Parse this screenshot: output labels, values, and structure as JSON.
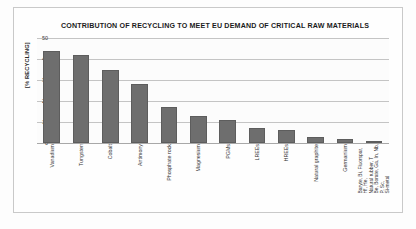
{
  "chart_data": {
    "type": "bar",
    "title": "CONTRIBUTION OF RECYCLING TO MEET EU DEMAND OF CRITICAL RAW MATERIALS",
    "xlabel": "",
    "ylabel": "[% RECYCLING]",
    "ylim": [
      0,
      50
    ],
    "yticks": [
      0,
      10,
      20,
      30,
      40,
      50
    ],
    "grid": true,
    "legend": false,
    "bar_color": "#6e6e6e",
    "categories": [
      "Vanadium",
      "Tungsten",
      "Cobalt",
      "Antimony",
      "Phosphate rock",
      "Magnesium",
      "PGMs",
      "LREEs",
      "HREEs",
      "Natural graphite",
      "Germanium",
      "Baryte, Bi, Fluorspar,\nHf, He,\nNatural rubber, T\nBe, Borate, Ga, In, Nb,\nP, Sc,\nSi-metal"
    ],
    "values": [
      44,
      42,
      35,
      28,
      17,
      13,
      11,
      7,
      6,
      3,
      2,
      1
    ]
  },
  "yticks_text": [
    "50",
    "40",
    "30",
    "20",
    "10",
    "0"
  ]
}
